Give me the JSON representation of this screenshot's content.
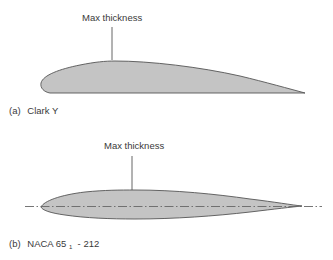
{
  "figure": {
    "panels": [
      {
        "id": "a",
        "annotation": "Max thickness",
        "caption_prefix": "(a)",
        "caption_name": "Clark Y",
        "airfoil_fill": "#c4c4c4",
        "outline_color": "#555555",
        "has_chord_line": false
      },
      {
        "id": "b",
        "annotation": "Max thickness",
        "caption_prefix": "(b)",
        "caption_name_main": "NACA 65",
        "caption_name_sub": "1",
        "caption_name_tail": " - 212",
        "airfoil_fill": "#c4c4c4",
        "outline_color": "#555555",
        "has_chord_line": true
      }
    ]
  }
}
